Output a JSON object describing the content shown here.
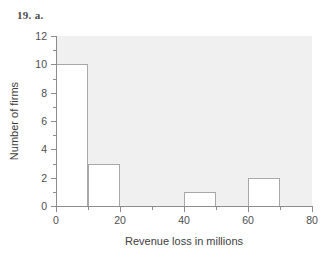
{
  "figure": {
    "label": "19. a."
  },
  "chart_data": {
    "type": "bar",
    "title": "",
    "subtitle": "",
    "xlabel": "Revenue loss in millions",
    "ylabel": "Number of firms",
    "grid": false,
    "legend": null,
    "xlim": [
      0,
      80
    ],
    "ylim": [
      0,
      12
    ],
    "bin_width": 10,
    "x_major_ticks": [
      0,
      20,
      40,
      60,
      80
    ],
    "x_minor_ticks": [
      10,
      30,
      50,
      70
    ],
    "x_tick_labels": [
      "0",
      "20",
      "40",
      "60",
      "80"
    ],
    "y_major_ticks": [
      0,
      2,
      4,
      6,
      8,
      10,
      12
    ],
    "y_minor_ticks": [
      1,
      3,
      5,
      7,
      9,
      11
    ],
    "y_tick_labels": [
      "0",
      "2",
      "4",
      "6",
      "8",
      "10",
      "12"
    ],
    "categories": [
      "0-10",
      "10-20",
      "20-30",
      "30-40",
      "40-50",
      "50-60",
      "60-70",
      "70-80"
    ],
    "bins": [
      {
        "start": 0,
        "end": 10,
        "value": 10
      },
      {
        "start": 10,
        "end": 20,
        "value": 3
      },
      {
        "start": 20,
        "end": 30,
        "value": 0
      },
      {
        "start": 30,
        "end": 40,
        "value": 0
      },
      {
        "start": 40,
        "end": 50,
        "value": 1
      },
      {
        "start": 50,
        "end": 60,
        "value": 0
      },
      {
        "start": 60,
        "end": 70,
        "value": 2
      },
      {
        "start": 70,
        "end": 80,
        "value": 0
      }
    ],
    "values": [
      10,
      3,
      0,
      0,
      1,
      0,
      2,
      0
    ],
    "colors": {
      "plot_background": "#f0f0f0",
      "page_background": "#ffffff",
      "bar_fill": "#ffffff",
      "bar_stroke": "#a8a8a8",
      "axis_line": "#8c8c8c",
      "tick_text": "#4d4d4d",
      "axis_title": "#3d3d3d",
      "figure_label": "#4a4a4a"
    }
  }
}
